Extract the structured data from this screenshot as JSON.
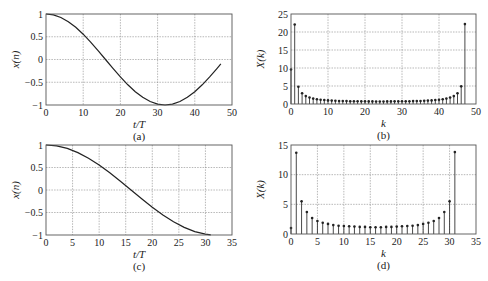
{
  "chart_data": [
    {
      "id": "a",
      "type": "line",
      "caption": "(a)",
      "title": "",
      "xlabel": "t/T",
      "ylabel": "x(n)",
      "xlim": [
        0,
        50
      ],
      "ylim": [
        -1,
        1
      ],
      "xticks": [
        0,
        10,
        20,
        30,
        40,
        50
      ],
      "yticks": [
        -1,
        -0.5,
        0,
        0.5,
        1
      ],
      "ytick_labels": [
        "-1",
        "-0.5",
        "0",
        "0.5",
        "1"
      ],
      "grid": true,
      "series": [
        {
          "name": "x(n) = cos(2*pi*n/64), n = 0..47",
          "x": [
            0,
            2,
            4,
            6,
            8,
            10,
            12,
            14,
            16,
            18,
            20,
            22,
            24,
            26,
            28,
            30,
            32,
            34,
            36,
            38,
            40,
            42,
            44,
            46,
            47
          ],
          "values": [
            1.0,
            0.981,
            0.924,
            0.831,
            0.707,
            0.556,
            0.383,
            0.195,
            0.0,
            -0.195,
            -0.383,
            -0.556,
            -0.707,
            -0.831,
            -0.924,
            -0.981,
            -1.0,
            -0.981,
            -0.924,
            -0.831,
            -0.707,
            -0.556,
            -0.383,
            -0.195,
            -0.098
          ]
        }
      ],
      "box": {
        "left": 46,
        "top": 14,
        "right": 232,
        "bottom": 105
      }
    },
    {
      "id": "b",
      "type": "stem",
      "caption": "(b)",
      "title": "",
      "xlabel": "k",
      "ylabel": "X(k)",
      "xlim": [
        0,
        50
      ],
      "ylim": [
        0,
        25
      ],
      "xticks": [
        0,
        10,
        20,
        30,
        40,
        50
      ],
      "yticks": [
        0,
        5,
        10,
        15,
        20,
        25
      ],
      "ytick_labels": [
        "0",
        "5",
        "10",
        "15",
        "20",
        "25"
      ],
      "grid": true,
      "series": [
        {
          "name": "|X(k)|, N = 48",
          "x": [
            0,
            1,
            2,
            3,
            4,
            5,
            6,
            7,
            8,
            9,
            10,
            11,
            12,
            13,
            14,
            15,
            16,
            17,
            18,
            19,
            20,
            21,
            22,
            23,
            24,
            25,
            26,
            27,
            28,
            29,
            30,
            31,
            32,
            33,
            34,
            35,
            36,
            37,
            38,
            39,
            40,
            41,
            42,
            43,
            44,
            45,
            46,
            47
          ],
          "values": [
            9.6,
            22.1,
            4.8,
            3.0,
            2.2,
            1.8,
            1.5,
            1.3,
            1.2,
            1.1,
            1.0,
            0.95,
            0.9,
            0.85,
            0.82,
            0.8,
            0.78,
            0.76,
            0.75,
            0.74,
            0.73,
            0.72,
            0.72,
            0.71,
            0.71,
            0.71,
            0.72,
            0.72,
            0.73,
            0.74,
            0.75,
            0.76,
            0.78,
            0.8,
            0.82,
            0.85,
            0.9,
            0.95,
            1.0,
            1.1,
            1.2,
            1.3,
            1.5,
            1.8,
            2.2,
            3.0,
            4.9,
            22.2
          ]
        }
      ],
      "box": {
        "left": 291,
        "top": 14,
        "right": 476,
        "bottom": 104
      }
    },
    {
      "id": "c",
      "type": "line",
      "caption": "(c)",
      "title": "",
      "xlabel": "t/T",
      "ylabel": "x(n)",
      "xlim": [
        0,
        35
      ],
      "ylim": [
        -1,
        1
      ],
      "xticks": [
        0,
        5,
        10,
        15,
        20,
        25,
        30,
        35
      ],
      "yticks": [
        -1,
        -0.5,
        0,
        0.5,
        1
      ],
      "ytick_labels": [
        "-1",
        "-0.5",
        "0",
        "0.5",
        "1"
      ],
      "grid": true,
      "series": [
        {
          "name": "x(n) = cos(2*pi*n/64), n = 0..31",
          "x": [
            0,
            2,
            4,
            6,
            8,
            10,
            12,
            14,
            16,
            18,
            20,
            22,
            24,
            26,
            28,
            30,
            31
          ],
          "values": [
            1.0,
            0.981,
            0.924,
            0.831,
            0.707,
            0.556,
            0.383,
            0.195,
            0.0,
            -0.195,
            -0.383,
            -0.556,
            -0.707,
            -0.831,
            -0.924,
            -0.981,
            -0.995
          ]
        }
      ],
      "box": {
        "left": 46,
        "top": 145,
        "right": 232,
        "bottom": 235
      }
    },
    {
      "id": "d",
      "type": "stem",
      "caption": "(d)",
      "title": "",
      "xlabel": "k",
      "ylabel": "X(k)",
      "xlim": [
        0,
        35
      ],
      "ylim": [
        0,
        15
      ],
      "xticks": [
        0,
        5,
        10,
        15,
        20,
        25,
        30,
        35
      ],
      "yticks": [
        0,
        5,
        10,
        15
      ],
      "ytick_labels": [
        "0",
        "5",
        "10",
        "15"
      ],
      "grid": true,
      "series": [
        {
          "name": "|X(k)|, N = 32",
          "x": [
            0,
            1,
            2,
            3,
            4,
            5,
            6,
            7,
            8,
            9,
            10,
            11,
            12,
            13,
            14,
            15,
            16,
            17,
            18,
            19,
            20,
            21,
            22,
            23,
            24,
            25,
            26,
            27,
            28,
            29,
            30,
            31
          ],
          "values": [
            1.0,
            13.7,
            5.5,
            3.7,
            2.7,
            2.2,
            1.9,
            1.7,
            1.5,
            1.4,
            1.35,
            1.3,
            1.25,
            1.2,
            1.2,
            1.15,
            1.15,
            1.15,
            1.2,
            1.2,
            1.25,
            1.3,
            1.35,
            1.4,
            1.5,
            1.7,
            1.9,
            2.2,
            2.7,
            3.7,
            5.5,
            13.8
          ]
        }
      ],
      "box": {
        "left": 291,
        "top": 145,
        "right": 476,
        "bottom": 234
      }
    }
  ]
}
